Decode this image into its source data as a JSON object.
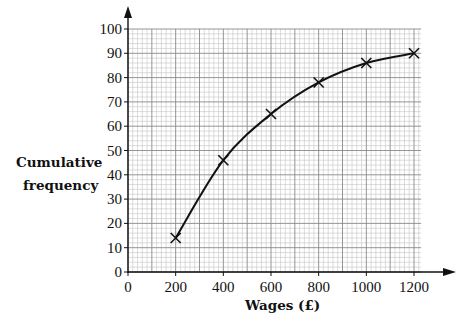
{
  "chart_data": {
    "type": "line",
    "title": "",
    "xlabel": "Wages (£)",
    "ylabel": "Cumulative frequency",
    "ylabel_lines": [
      "Cumulative",
      "frequency"
    ],
    "x": [
      200,
      400,
      600,
      800,
      1000,
      1200
    ],
    "values": [
      14,
      46,
      65,
      78,
      86,
      90
    ],
    "series": [
      {
        "name": "Cumulative frequency",
        "x": [
          200,
          400,
          600,
          800,
          1000,
          1200
        ],
        "values": [
          14,
          46,
          65,
          78,
          86,
          90
        ],
        "marker": "x",
        "curve": "smooth"
      }
    ],
    "xlim": [
      0,
      1200
    ],
    "ylim": [
      0,
      100
    ],
    "x_ticks": [
      0,
      200,
      400,
      600,
      800,
      1000,
      1200
    ],
    "y_ticks": [
      0,
      10,
      20,
      30,
      40,
      50,
      60,
      70,
      80,
      90,
      100
    ],
    "grid": {
      "major_x": 100,
      "minor_x": 20,
      "major_y": 10,
      "minor_y": 2
    },
    "legend": null
  },
  "colors": {
    "line": "#111111",
    "grid_major": "#8a8a8a",
    "grid_minor": "#c4c4c4",
    "axis": "#111111"
  }
}
